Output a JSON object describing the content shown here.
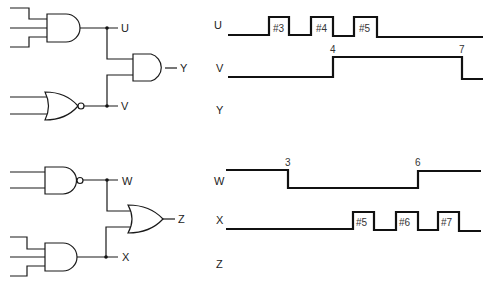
{
  "circuit_top": {
    "gates": [
      {
        "id": "and1",
        "type": "AND",
        "inputs": 3,
        "output": "U"
      },
      {
        "id": "nor1",
        "type": "NOR",
        "inputs": 2,
        "output": "V"
      },
      {
        "id": "and2",
        "type": "AND",
        "inputs": [
          "U",
          "V"
        ],
        "output": "Y"
      }
    ],
    "labels": {
      "u": "U",
      "v": "V",
      "y": "Y"
    }
  },
  "circuit_bottom": {
    "gates": [
      {
        "id": "nand1",
        "type": "NAND",
        "inputs": 2,
        "output": "W"
      },
      {
        "id": "and3",
        "type": "AND",
        "inputs": 3,
        "output": "X"
      },
      {
        "id": "or1",
        "type": "OR",
        "inputs": [
          "W",
          "X"
        ],
        "output": "Z"
      }
    ],
    "labels": {
      "w": "W",
      "x": "X",
      "z": "Z"
    }
  },
  "waveforms": {
    "top": {
      "u": {
        "label": "U",
        "pulses": [
          "#3",
          "#4",
          "#5"
        ]
      },
      "v": {
        "label": "V",
        "rise_label": "4",
        "fall_label": "7"
      },
      "y": {
        "label": "Y"
      }
    },
    "bottom": {
      "w": {
        "label": "W",
        "fall_label": "3",
        "rise_label": "6"
      },
      "x": {
        "label": "X",
        "pulses": [
          "#5",
          "#6",
          "#7"
        ]
      },
      "z": {
        "label": "Z"
      }
    }
  },
  "colors": {
    "line": "#111111",
    "background": "#ffffff"
  }
}
